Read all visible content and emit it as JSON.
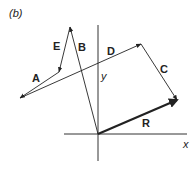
{
  "figure": {
    "panel_label": "(b)",
    "axes": {
      "x_label": "x",
      "y_label": "y",
      "origin": [
        98,
        134
      ]
    },
    "vectors": [
      {
        "name": "B",
        "from": [
          98,
          134
        ],
        "to": [
          70,
          27
        ],
        "label": "B",
        "label_pos": [
          78,
          51
        ],
        "thick": false
      },
      {
        "name": "E",
        "from": [
          70,
          27
        ],
        "to": [
          59,
          72
        ],
        "label": "E",
        "label_pos": [
          53,
          50
        ],
        "thick": false
      },
      {
        "name": "A",
        "from": [
          59,
          72
        ],
        "to": [
          20,
          98
        ],
        "label": "A",
        "label_pos": [
          32,
          82
        ],
        "thick": false
      },
      {
        "name": "D",
        "from": [
          20,
          98
        ],
        "to": [
          141,
          44
        ],
        "label": "D",
        "label_pos": [
          107,
          55
        ],
        "thick": false
      },
      {
        "name": "C",
        "from": [
          141,
          44
        ],
        "to": [
          177,
          100
        ],
        "label": "C",
        "label_pos": [
          160,
          73
        ],
        "thick": false
      },
      {
        "name": "R",
        "from": [
          98,
          134
        ],
        "to": [
          177,
          100
        ],
        "label": "R",
        "label_pos": [
          142,
          127
        ],
        "thick": true
      }
    ]
  }
}
